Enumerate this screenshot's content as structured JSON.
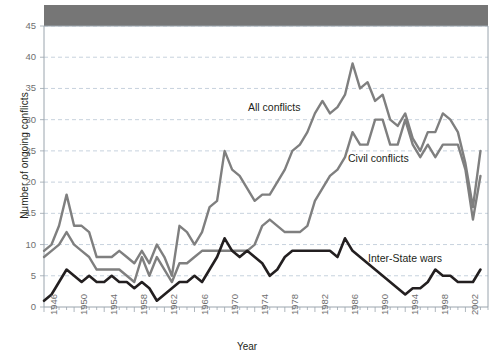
{
  "chart_data": {
    "type": "line",
    "title": "",
    "xlabel": "Year",
    "ylabel": "Number of ongoing conflicts",
    "xlim": [
      1946,
      2005
    ],
    "ylim": [
      0,
      45
    ],
    "grid": true,
    "grid_style": "dashed-horizontal",
    "legend_position": "inline-annotations",
    "xticks": [
      "1946",
      "1950",
      "1954",
      "1958",
      "1962",
      "1966",
      "1970",
      "1974",
      "1978",
      "1982",
      "1986",
      "1990",
      "1994",
      "1998",
      "2002"
    ],
    "xtick_values": [
      1946,
      1950,
      1954,
      1958,
      1962,
      1966,
      1970,
      1974,
      1978,
      1982,
      1986,
      1990,
      1994,
      1998,
      2002
    ],
    "yticks": [
      "0",
      "5",
      "10",
      "15",
      "20",
      "25",
      "30",
      "35",
      "40",
      "45"
    ],
    "ytick_values": [
      0,
      5,
      10,
      15,
      20,
      25,
      30,
      35,
      40,
      45
    ],
    "x": [
      1946,
      1947,
      1948,
      1949,
      1950,
      1951,
      1952,
      1953,
      1954,
      1955,
      1956,
      1957,
      1958,
      1959,
      1960,
      1961,
      1962,
      1963,
      1964,
      1965,
      1966,
      1967,
      1968,
      1969,
      1970,
      1971,
      1972,
      1973,
      1974,
      1975,
      1976,
      1977,
      1978,
      1979,
      1980,
      1981,
      1982,
      1983,
      1984,
      1985,
      1986,
      1987,
      1988,
      1989,
      1990,
      1991,
      1992,
      1993,
      1994,
      1995,
      1996,
      1997,
      1998,
      1999,
      2000,
      2001,
      2002,
      2003,
      2004
    ],
    "series": [
      {
        "name": "All conflicts",
        "color": "#7f7f7f",
        "label_x": 248,
        "label_y": 101,
        "values": [
          9,
          10,
          13,
          18,
          13,
          13,
          12,
          8,
          8,
          8,
          9,
          8,
          7,
          9,
          7,
          10,
          8,
          5,
          13,
          12,
          10,
          12,
          16,
          17,
          25,
          22,
          21,
          19,
          17,
          18,
          18,
          20,
          22,
          25,
          26,
          28,
          31,
          33,
          31,
          32,
          34,
          39,
          35,
          36,
          33,
          34,
          30,
          29,
          31,
          27,
          25,
          28,
          28,
          31,
          30,
          28,
          23,
          16,
          25
        ]
      },
      {
        "name": "Civil conflicts",
        "color": "#7f7f7f",
        "label_x": 348,
        "label_y": 152,
        "values": [
          8,
          9,
          10,
          12,
          10,
          9,
          8,
          6,
          6,
          6,
          6,
          5,
          4,
          8,
          5,
          8,
          6,
          4,
          7,
          7,
          8,
          9,
          9,
          9,
          9,
          9,
          9,
          9,
          10,
          13,
          14,
          13,
          12,
          12,
          12,
          13,
          17,
          19,
          21,
          22,
          24,
          28,
          26,
          26,
          30,
          30,
          26,
          26,
          30,
          26,
          24,
          26,
          24,
          26,
          26,
          26,
          22,
          14,
          21
        ]
      },
      {
        "name": "Inter-State wars",
        "color": "#231f20",
        "label_x": 368,
        "label_y": 252,
        "values": [
          1,
          2,
          4,
          6,
          5,
          4,
          5,
          4,
          4,
          5,
          4,
          4,
          3,
          4,
          3,
          1,
          2,
          3,
          4,
          4,
          5,
          4,
          6,
          8,
          11,
          9,
          8,
          9,
          8,
          7,
          5,
          6,
          8,
          9,
          9,
          9,
          9,
          9,
          9,
          8,
          11,
          9,
          8,
          7,
          6,
          5,
          4,
          3,
          2,
          3,
          3,
          4,
          6,
          5,
          5,
          4,
          4,
          4,
          6
        ]
      }
    ],
    "top_band": {
      "color": "#767676",
      "from_y": 45,
      "label": ""
    }
  }
}
